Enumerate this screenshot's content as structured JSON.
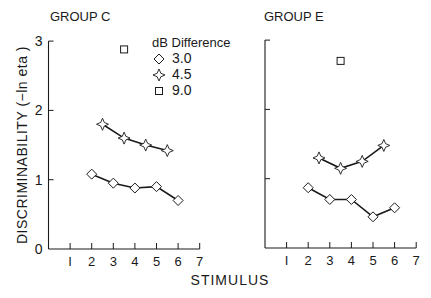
{
  "figure": {
    "ylabel": "DISCRIMINABILITY (−ln eta )",
    "xlabel": "STIMULUS",
    "legend_title": "dB Difference"
  },
  "chart_data": [
    {
      "type": "line",
      "title": "GROUP C",
      "xlabel": "STIMULUS",
      "ylabel": "DISCRIMINABILITY (−ln eta )",
      "xlim": [
        0,
        7
      ],
      "ylim": [
        0,
        3
      ],
      "xticks": [
        1,
        2,
        3,
        4,
        5,
        6,
        7
      ],
      "yticks": [
        0,
        1,
        2,
        3
      ],
      "grid": false,
      "legend": {
        "title": "dB Difference",
        "position": "upper right",
        "entries": [
          "3.0",
          "4.5",
          "9.0"
        ]
      },
      "series": [
        {
          "name": "3.0",
          "marker": "diamond",
          "x": [
            2,
            3,
            4,
            5,
            6
          ],
          "values": [
            1.08,
            0.95,
            0.88,
            0.9,
            0.7
          ]
        },
        {
          "name": "4.5",
          "marker": "star",
          "x": [
            2.5,
            3.5,
            4.5,
            5.5
          ],
          "values": [
            1.8,
            1.6,
            1.5,
            1.42
          ]
        },
        {
          "name": "9.0",
          "marker": "square",
          "x": [
            3.5
          ],
          "values": [
            2.88
          ]
        }
      ]
    },
    {
      "type": "line",
      "title": "GROUP E",
      "xlabel": "STIMULUS",
      "ylabel": "",
      "xlim": [
        0,
        7
      ],
      "ylim": [
        0,
        3
      ],
      "xticks": [
        1,
        2,
        3,
        4,
        5,
        6,
        7
      ],
      "yticks": [
        0,
        1,
        2,
        3
      ],
      "grid": false,
      "series": [
        {
          "name": "3.0",
          "marker": "diamond",
          "x": [
            2,
            3,
            4,
            5,
            6
          ],
          "values": [
            0.87,
            0.7,
            0.7,
            0.45,
            0.58
          ]
        },
        {
          "name": "4.5",
          "marker": "star",
          "x": [
            2.5,
            3.5,
            4.5,
            5.5
          ],
          "values": [
            1.3,
            1.15,
            1.25,
            1.48
          ]
        },
        {
          "name": "9.0",
          "marker": "square",
          "x": [
            3.5
          ],
          "values": [
            2.7
          ]
        }
      ]
    }
  ],
  "colors": {
    "ink": "#1a1a1a",
    "background": "#ffffff"
  }
}
